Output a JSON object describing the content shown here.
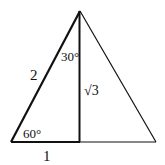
{
  "diagram": {
    "type": "geometry",
    "colors": {
      "stroke": "#111111",
      "background": "#ffffff",
      "text": "#111111"
    },
    "vertices": {
      "apex": [
        80,
        11
      ],
      "bottom_left": [
        11,
        142
      ],
      "bottom_right": [
        156,
        142
      ],
      "foot_of_altitude": [
        79,
        142
      ]
    },
    "labels": {
      "hypotenuse": "2",
      "top_angle": "30°",
      "bottom_angle": "60°",
      "altitude": "√3",
      "half_base": "1"
    }
  }
}
